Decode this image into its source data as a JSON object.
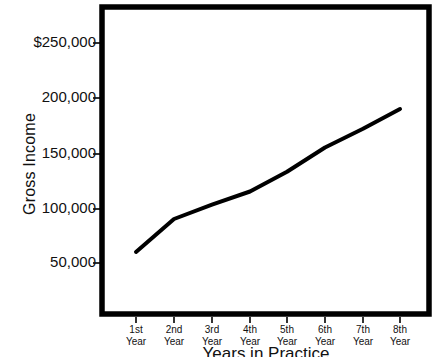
{
  "chart_data": {
    "type": "line",
    "title": "",
    "xlabel": "Years in Practice",
    "ylabel": "Gross Income",
    "categories": [
      "1st\nYear",
      "2nd\nYear",
      "3rd\nYear",
      "4th\nYear",
      "5th\nYear",
      "6th\nYear",
      "7th\nYear",
      "8th\nYear"
    ],
    "category_lines": [
      [
        "1st",
        "Year"
      ],
      [
        "2nd",
        "Year"
      ],
      [
        "3rd",
        "Year"
      ],
      [
        "4th",
        "Year"
      ],
      [
        "5th",
        "Year"
      ],
      [
        "6th",
        "Year"
      ],
      [
        "7th",
        "Year"
      ],
      [
        "8th",
        "Year"
      ]
    ],
    "values": [
      60000,
      90000,
      103000,
      115000,
      133000,
      155000,
      172000,
      190000
    ],
    "ylim": [
      0,
      275000
    ],
    "xlim": [
      0,
      9
    ],
    "yticks": [
      50000,
      100000,
      150000,
      200000,
      250000
    ],
    "ytick_labels": [
      "50,000",
      "100,000",
      "150,000",
      "200,000",
      "$250,000"
    ],
    "grid": false,
    "legend": false,
    "series_color": "#000000",
    "frame_color": "#000000",
    "background": "#ffffff"
  },
  "axis": {
    "y_title": "Gross Income",
    "x_title": "Years in Practice"
  }
}
